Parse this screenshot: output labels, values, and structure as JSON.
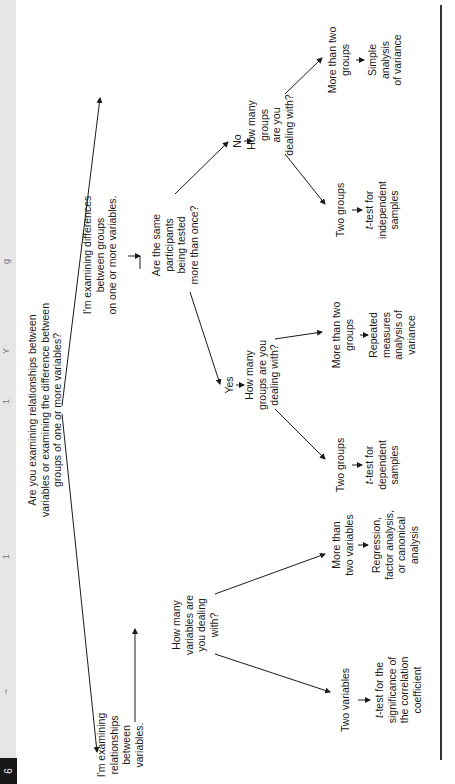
{
  "header": {
    "page_marker": "6",
    "fragments": [
      "g",
      "Y",
      "1",
      "1",
      "~"
    ]
  },
  "diagram": {
    "root_question": [
      "Are you examining relationships between",
      "variables or examining the difference between",
      "groups of one or more variables?"
    ],
    "relationships_branch": {
      "label": [
        "I'm examining",
        "relationships",
        "between",
        "variables."
      ],
      "question": [
        "How many",
        "variables are",
        "you dealing",
        "with?"
      ],
      "two_variables": {
        "label": [
          "Two variables"
        ],
        "test": [
          "t-test for the",
          "significance of",
          "the correlation",
          "coefficient"
        ]
      },
      "more_than_two_variables": {
        "label": [
          "More than",
          "two variables"
        ],
        "test": [
          "Regression,",
          "factor analysis,",
          "or canonical",
          "analysis"
        ]
      }
    },
    "differences_branch": {
      "label": [
        "I'm examining differences",
        "between groups",
        "on one or more variables."
      ],
      "question": [
        "Are the same",
        "participants",
        "being tested",
        "more than once?"
      ],
      "yes": {
        "answer": "Yes",
        "question": [
          "How many",
          "groups are you",
          "dealing with?"
        ],
        "two_groups": {
          "label": [
            "Two groups"
          ],
          "test": [
            "t-test for",
            "dependent",
            "samples"
          ]
        },
        "more_than_two_groups": {
          "label": [
            "More than two",
            "groups"
          ],
          "test": [
            "Repeated",
            "measures",
            "analysis of",
            "variance"
          ]
        }
      },
      "no": {
        "answer": "No",
        "question": [
          "How many",
          "groups",
          "are you",
          "dealing with?"
        ],
        "two_groups": {
          "label": [
            "Two groups"
          ],
          "test": [
            "t-test for",
            "independent",
            "samples"
          ]
        },
        "more_than_two_groups": {
          "label": [
            "More than two",
            "groups"
          ],
          "test": [
            "Simple",
            "analysis",
            "of variance"
          ]
        }
      }
    }
  },
  "colors": {
    "ink": "#1a1a1a",
    "header_band": "#e6e6e6",
    "header_block": "#161616"
  }
}
